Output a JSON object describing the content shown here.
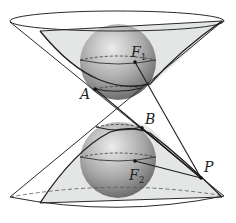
{
  "diagram": {
    "points": {
      "A": {
        "label": "A"
      },
      "B": {
        "label": "B"
      },
      "F1": {
        "label": "F",
        "sub": "1"
      },
      "F2": {
        "label": "F",
        "sub": "2"
      },
      "P": {
        "label": "P"
      }
    },
    "colors": {
      "stroke": "#2a2a2a",
      "plane_fill": "#d9dcdc",
      "sphere_light": "#e6e6e6",
      "sphere_dark": "#6e6e6e"
    }
  }
}
